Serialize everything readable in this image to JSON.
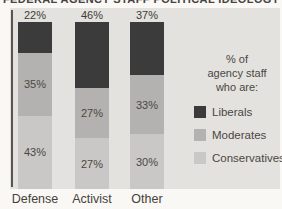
{
  "header": {
    "cropped_text": "FEDERAL AGENCY STAFF POLITICAL IDEOLOGY"
  },
  "colors": {
    "page_background": "#f9f8f5",
    "panel_background": "#e3e2df",
    "axis_line": "#58544f",
    "liberals": "#3b3b3b",
    "moderates": "#b3b2b0",
    "conservatives": "#c9c8c6"
  },
  "chart_data": {
    "type": "bar",
    "subtype": "stacked-vertical-100pct",
    "categories": [
      "Defense",
      "Activist",
      "Other"
    ],
    "series": [
      {
        "name": "Liberals",
        "color": "#3b3b3b",
        "values": [
          22,
          46,
          37
        ],
        "labels": [
          "22%",
          "46%",
          "37%"
        ]
      },
      {
        "name": "Moderates",
        "color": "#b3b2b0",
        "values": [
          35,
          27,
          33
        ],
        "labels": [
          "35%",
          "27%",
          "33%"
        ]
      },
      {
        "name": "Conservatives",
        "color": "#c9c8c6",
        "values": [
          43,
          27,
          30
        ],
        "labels": [
          "43%",
          "27%",
          "30%"
        ]
      }
    ],
    "stack_order_top_to_bottom": [
      "Liberals",
      "Moderates",
      "Conservatives"
    ],
    "value_labels": "top segment labeled above bar; lower segments labeled inside",
    "ylim": [
      0,
      100
    ],
    "grid": false,
    "legend_position": "right",
    "legend": {
      "title_lines": [
        "% of",
        "agency staff",
        "who are:"
      ],
      "entries": [
        "Liberals",
        "Moderates",
        "Conservatives"
      ]
    }
  }
}
